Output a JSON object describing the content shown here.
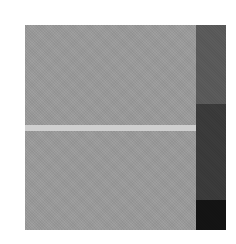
{
  "figure": {
    "main_area": {
      "color": "#9a9a9a"
    },
    "stripe": {
      "color": "#cfcfcf",
      "top": 100,
      "height": 6
    },
    "side_column": {
      "blocks": [
        {
          "color": "#5c5c5c",
          "top": 0,
          "height": 79
        },
        {
          "color": "#3c3c3c",
          "top": 79,
          "height": 96
        },
        {
          "color": "#141414",
          "top": 175,
          "height": 30
        }
      ]
    }
  }
}
